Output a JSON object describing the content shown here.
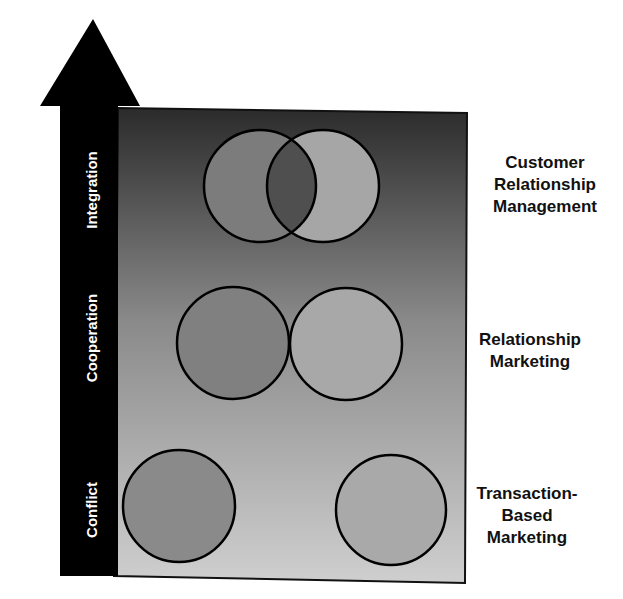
{
  "diagram": {
    "axis": {
      "direction": "up",
      "stages": [
        {
          "label": "Integration"
        },
        {
          "label": "Cooperation"
        },
        {
          "label": "Conflict"
        }
      ]
    },
    "levels": [
      {
        "label_lines": [
          "Customer",
          "Relationship",
          "Management"
        ],
        "relation": "overlapping circles"
      },
      {
        "label_lines": [
          "Relationship",
          "Marketing"
        ],
        "relation": "touching circles"
      },
      {
        "label_lines": [
          "Transaction-",
          "Based",
          "Marketing"
        ],
        "relation": "separated circles"
      }
    ],
    "colors": {
      "arrow": "#000000",
      "panel_top": "#2e2e2e",
      "panel_bottom": "#c8c8c8",
      "circle_dark": "#7a7a7a",
      "circle_light": "#a8a8a8",
      "overlap": "#4a4a4a"
    }
  }
}
